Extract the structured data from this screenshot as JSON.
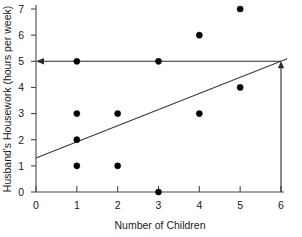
{
  "chart_data": {
    "type": "scatter",
    "title": "",
    "xlabel": "Number of Children",
    "ylabel": "Husband's Housework (hours per week)",
    "xlim": [
      0,
      6
    ],
    "ylim": [
      0,
      7
    ],
    "xticks": [
      "0",
      "1",
      "2",
      "3",
      "4",
      "5",
      "6"
    ],
    "yticks": [
      "0",
      "1",
      "2",
      "3",
      "4",
      "5",
      "6",
      "7"
    ],
    "grid": false,
    "legend": "none",
    "points": [
      {
        "x": 1,
        "y": 5
      },
      {
        "x": 1,
        "y": 3
      },
      {
        "x": 1,
        "y": 2
      },
      {
        "x": 1,
        "y": 1
      },
      {
        "x": 2,
        "y": 3
      },
      {
        "x": 2,
        "y": 1
      },
      {
        "x": 3,
        "y": 5
      },
      {
        "x": 3,
        "y": 0
      },
      {
        "x": 4,
        "y": 6
      },
      {
        "x": 4,
        "y": 3
      },
      {
        "x": 5,
        "y": 7
      },
      {
        "x": 5,
        "y": 4
      }
    ],
    "series": [
      {
        "name": "Observations",
        "x": [
          1,
          1,
          1,
          1,
          2,
          2,
          3,
          3,
          4,
          4,
          5,
          5
        ],
        "values": [
          5,
          3,
          2,
          1,
          3,
          1,
          5,
          0,
          6,
          3,
          7,
          4
        ]
      }
    ],
    "regression_line": {
      "name": "Regression line",
      "x_start": 0,
      "y_start": 1.3,
      "x_end": 6.15,
      "y_end": 5.1,
      "intercept": 1.3,
      "slope": 0.617
    },
    "annotations": [
      {
        "name": "vertical-prediction-guide",
        "type": "arrow",
        "from_x": 6,
        "from_y": 0,
        "to_x": 6,
        "to_y": 5,
        "direction": "up"
      },
      {
        "name": "horizontal-prediction-guide",
        "type": "arrow",
        "from_x": 6,
        "from_y": 5,
        "to_x": 0,
        "to_y": 5,
        "direction": "left"
      }
    ],
    "colors": {
      "point": "#000000",
      "regression": "#3a3a3a",
      "guide": "#2a2a2a",
      "axis": "#4a4a4a",
      "background": "#ffffff"
    }
  }
}
